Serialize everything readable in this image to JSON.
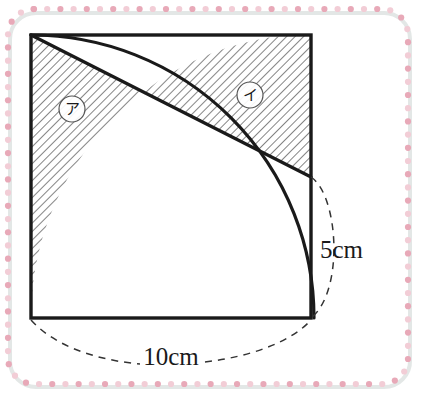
{
  "figure": {
    "square": {
      "side_label": "10cm",
      "x": 31,
      "y": 35,
      "width": 280,
      "height": 283,
      "stroke": "#1a1a1a",
      "stroke_width": 3.2
    },
    "arc": {
      "description": "quarter-circle-centered-bottom-left",
      "center_x": 31,
      "center_y": 318,
      "radius": 283,
      "stroke": "#1a1a1a",
      "stroke_width": 3.2
    },
    "diagonal": {
      "description": "line-top-left-to-right-edge-midpoint",
      "x1": 31,
      "y1": 35,
      "x2": 311,
      "y2": 177,
      "stroke": "#1a1a1a",
      "stroke_width": 3.2
    },
    "intersection": {
      "x": 142,
      "y": 93
    },
    "hatch": {
      "color": "#3a3a3a",
      "spacing": 6,
      "angle_deg": 45
    },
    "regions": [
      {
        "id": "region-a",
        "label": "ア",
        "cx": 72,
        "cy": 109,
        "radius": 13
      },
      {
        "id": "region-b",
        "label": "イ",
        "cx": 250,
        "cy": 95,
        "radius": 13
      }
    ],
    "dimensions": [
      {
        "id": "dim-height",
        "label": "5cm",
        "text_x": 320,
        "text_y": 258,
        "anchor": "start"
      },
      {
        "id": "dim-width",
        "label": "10cm",
        "text_x": 171,
        "text_y": 365,
        "anchor": "middle"
      }
    ],
    "dashed": {
      "stroke": "#333333",
      "stroke_width": 1.5,
      "dash": "7 6"
    }
  },
  "frame": {
    "description": "decorative-dotted-rounded-border",
    "dot_color": "#e8a9b8",
    "dot_color_light": "#f2cdd6",
    "dot_radius": 3.1,
    "shadow_color": "#e3e7e6"
  }
}
